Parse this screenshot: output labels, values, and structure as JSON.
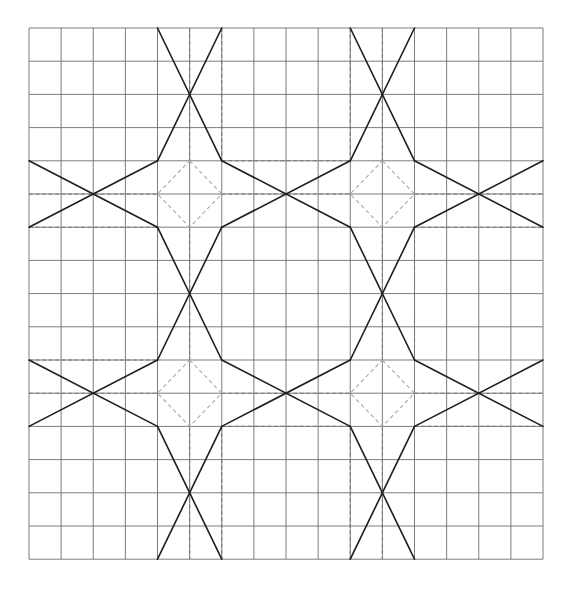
{
  "diagram": {
    "type": "geometric-star-pattern-on-grid",
    "grid": {
      "columns": 16,
      "rows": 16,
      "origin_px": [
        29,
        28
      ],
      "cell_w": 32.125,
      "cell_h": 33.2,
      "line_color": "#6e6e6e"
    },
    "colors": {
      "solid": "#1e1e1e",
      "dashed": "#777777",
      "diamond": "#a8a8a8",
      "background": "#ffffff"
    },
    "star_centers": [
      [
        5,
        5
      ],
      [
        11,
        5
      ],
      [
        5,
        11
      ],
      [
        11,
        11
      ]
    ],
    "solid_segments": [
      [
        [
          4,
          0
        ],
        [
          6,
          4
        ]
      ],
      [
        [
          6,
          0
        ],
        [
          4,
          4
        ]
      ],
      [
        [
          10,
          0
        ],
        [
          12,
          4
        ]
      ],
      [
        [
          12,
          0
        ],
        [
          10,
          4
        ]
      ],
      [
        [
          0,
          4
        ],
        [
          4,
          6
        ]
      ],
      [
        [
          0,
          6
        ],
        [
          4,
          4
        ]
      ],
      [
        [
          6,
          4
        ],
        [
          10,
          6
        ]
      ],
      [
        [
          6,
          6
        ],
        [
          10,
          4
        ]
      ],
      [
        [
          12,
          4
        ],
        [
          16,
          6
        ]
      ],
      [
        [
          12,
          6
        ],
        [
          16,
          4
        ]
      ],
      [
        [
          4,
          6
        ],
        [
          6,
          10
        ]
      ],
      [
        [
          6,
          6
        ],
        [
          4,
          10
        ]
      ],
      [
        [
          10,
          6
        ],
        [
          12,
          10
        ]
      ],
      [
        [
          12,
          6
        ],
        [
          10,
          10
        ]
      ],
      [
        [
          0,
          10
        ],
        [
          4,
          12
        ]
      ],
      [
        [
          0,
          12
        ],
        [
          4,
          10
        ]
      ],
      [
        [
          6,
          10
        ],
        [
          10,
          12
        ]
      ],
      [
        [
          6,
          12
        ],
        [
          10,
          10
        ]
      ],
      [
        [
          12,
          10
        ],
        [
          16,
          12
        ]
      ],
      [
        [
          12,
          12
        ],
        [
          16,
          10
        ]
      ],
      [
        [
          4,
          12
        ],
        [
          6,
          16
        ]
      ],
      [
        [
          6,
          12
        ],
        [
          4,
          16
        ]
      ],
      [
        [
          10,
          12
        ],
        [
          12,
          16
        ]
      ],
      [
        [
          12,
          12
        ],
        [
          10,
          16
        ]
      ]
    ],
    "dashed_segments": [
      [
        [
          5,
          0
        ],
        [
          5,
          4
        ]
      ],
      [
        [
          6,
          0
        ],
        [
          6,
          4
        ]
      ],
      [
        [
          10,
          0
        ],
        [
          10,
          4
        ]
      ],
      [
        [
          11,
          0
        ],
        [
          11,
          4
        ]
      ],
      [
        [
          0,
          5
        ],
        [
          4,
          5
        ]
      ],
      [
        [
          0,
          6
        ],
        [
          4,
          6
        ]
      ],
      [
        [
          6,
          4
        ],
        [
          10,
          4
        ]
      ],
      [
        [
          6,
          5
        ],
        [
          10,
          5
        ]
      ],
      [
        [
          12,
          5
        ],
        [
          16,
          5
        ]
      ],
      [
        [
          12,
          6
        ],
        [
          16,
          6
        ]
      ],
      [
        [
          4,
          6
        ],
        [
          4,
          10
        ]
      ],
      [
        [
          5,
          6
        ],
        [
          5,
          10
        ]
      ],
      [
        [
          11,
          6
        ],
        [
          11,
          10
        ]
      ],
      [
        [
          12,
          6
        ],
        [
          12,
          10
        ]
      ],
      [
        [
          0,
          10
        ],
        [
          4,
          10
        ]
      ],
      [
        [
          0,
          11
        ],
        [
          4,
          11
        ]
      ],
      [
        [
          6,
          11
        ],
        [
          10,
          11
        ]
      ],
      [
        [
          6,
          12
        ],
        [
          10,
          12
        ]
      ],
      [
        [
          12,
          11
        ],
        [
          16,
          11
        ]
      ],
      [
        [
          12,
          12
        ],
        [
          16,
          12
        ]
      ],
      [
        [
          5,
          12
        ],
        [
          5,
          16
        ]
      ],
      [
        [
          6,
          12
        ],
        [
          6,
          16
        ]
      ],
      [
        [
          10,
          12
        ],
        [
          10,
          16
        ]
      ],
      [
        [
          11,
          12
        ],
        [
          11,
          16
        ]
      ]
    ]
  }
}
